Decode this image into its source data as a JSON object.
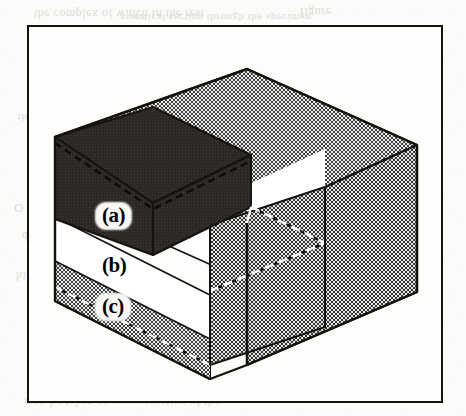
{
  "figure": {
    "kind": "isometric-cutaway-diagram",
    "frame": {
      "border_color": "#15120f",
      "fill": "#fdfdfc"
    },
    "labels": [
      {
        "id": "a",
        "text": "(a)",
        "layer": "top-layer",
        "style": "halo",
        "x": 68,
        "y": 177
      },
      {
        "id": "b",
        "text": "(b)",
        "layer": "middle-layer",
        "style": "plain",
        "x": 68,
        "y": 227
      },
      {
        "id": "c",
        "text": "(c)",
        "layer": "bottom-layer",
        "style": "halo",
        "x": 68,
        "y": 268
      }
    ],
    "layers": [
      {
        "id": "a",
        "name": "top-layer",
        "shading": "solid-dark",
        "color": "#2e2b28"
      },
      {
        "id": "b",
        "name": "middle-layer",
        "shading": "white",
        "color": "#ffffff"
      },
      {
        "id": "c",
        "name": "bottom-layer",
        "shading": "halftone-gray",
        "color": "#9a9a9a"
      }
    ],
    "colors": {
      "ink": "#15120f",
      "dark_fill": "#2e2b28",
      "white_fill": "#ffffff",
      "halftone_dark": "#3a3a3a",
      "halftone_light": "#d8d8d6",
      "hidden_line_light": "#ffffff",
      "hidden_line_dark": "#15120f",
      "page": "#fbfbf9"
    },
    "bleed_through": [
      {
        "text": "the complex of which in the rest",
        "x": 34,
        "y": 6,
        "size": 12
      },
      {
        "text": "a vertical section through the specimen",
        "x": 120,
        "y": 12,
        "size": 11
      },
      {
        "text": "figure",
        "x": 300,
        "y": 4,
        "size": 12
      },
      {
        "text": "the surface",
        "x": 18,
        "y": 112,
        "size": 11
      },
      {
        "text": "and the inner",
        "x": 350,
        "y": 128,
        "size": 11
      },
      {
        "text": "O",
        "x": 14,
        "y": 200,
        "size": 13
      },
      {
        "text": "distribution of the",
        "x": 22,
        "y": 228,
        "size": 12
      },
      {
        "text": "higher",
        "x": 16,
        "y": 268,
        "size": 12
      },
      {
        "text": "the",
        "x": 128,
        "y": 272,
        "size": 12
      },
      {
        "text": "size",
        "x": 222,
        "y": 270,
        "size": 12
      },
      {
        "text": "interior",
        "x": 300,
        "y": 306,
        "size": 12
      },
      {
        "text": "may be taken as representative of the",
        "x": 24,
        "y": 394,
        "size": 12
      }
    ]
  }
}
